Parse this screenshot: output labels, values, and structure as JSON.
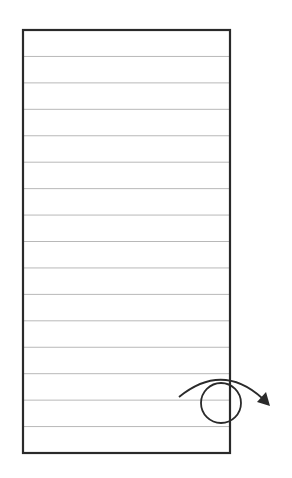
{
  "diagram": {
    "sheet": {
      "x": 23,
      "y": 30,
      "width": 207,
      "height": 423,
      "border_color": "#2a2a2a",
      "border_width": 2.2,
      "line_color": "#b8b8b8",
      "line_count": 15
    },
    "rotation_symbol": {
      "circle": {
        "cx": 221,
        "cy": 403,
        "r": 20,
        "color": "#2a2a2a"
      },
      "arrow": {
        "direction": "clockwise",
        "start": [
          179,
          397
        ],
        "end": [
          270,
          406
        ],
        "color": "#2a2a2a"
      }
    }
  }
}
